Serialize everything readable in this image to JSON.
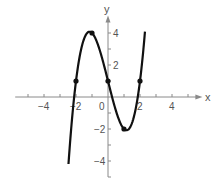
{
  "chart_data": {
    "type": "line",
    "title": "",
    "function": "f(x) = x^3 - 4x + 1",
    "xlabel": "x",
    "ylabel": "y",
    "xlim": [
      -5.8,
      5.9
    ],
    "ylim": [
      -5,
      5.1
    ],
    "grid": false,
    "legend": null,
    "x_ticks": [
      -5,
      -4,
      -3,
      -2,
      -1,
      1,
      2,
      3,
      4,
      5
    ],
    "x_tick_labels": [
      {
        "value": -4,
        "label": "−4"
      },
      {
        "value": -2,
        "label": "−2"
      },
      {
        "value": 0,
        "label": "0"
      },
      {
        "value": 2,
        "label": "2"
      },
      {
        "value": 4,
        "label": "4"
      }
    ],
    "y_ticks": [
      -5,
      -4,
      -3,
      -2,
      -1,
      1,
      2,
      3,
      4
    ],
    "y_tick_labels": [
      {
        "value": 4,
        "label": "4"
      },
      {
        "value": 2,
        "label": "2"
      },
      {
        "value": -2,
        "label": "−2"
      },
      {
        "value": -4,
        "label": "−4"
      }
    ],
    "series": [
      {
        "name": "f(x)",
        "x_range": [
          -2.47,
          2.31
        ],
        "color": "#111111"
      }
    ],
    "marked_points": [
      {
        "x": -2,
        "y": 1
      },
      {
        "x": -1,
        "y": 4
      },
      {
        "x": 0,
        "y": 1
      },
      {
        "x": 1,
        "y": -2
      },
      {
        "x": 2,
        "y": 1
      }
    ]
  },
  "colors": {
    "axis": "#8a8a8a",
    "curve": "#111111",
    "text": "#555555"
  }
}
